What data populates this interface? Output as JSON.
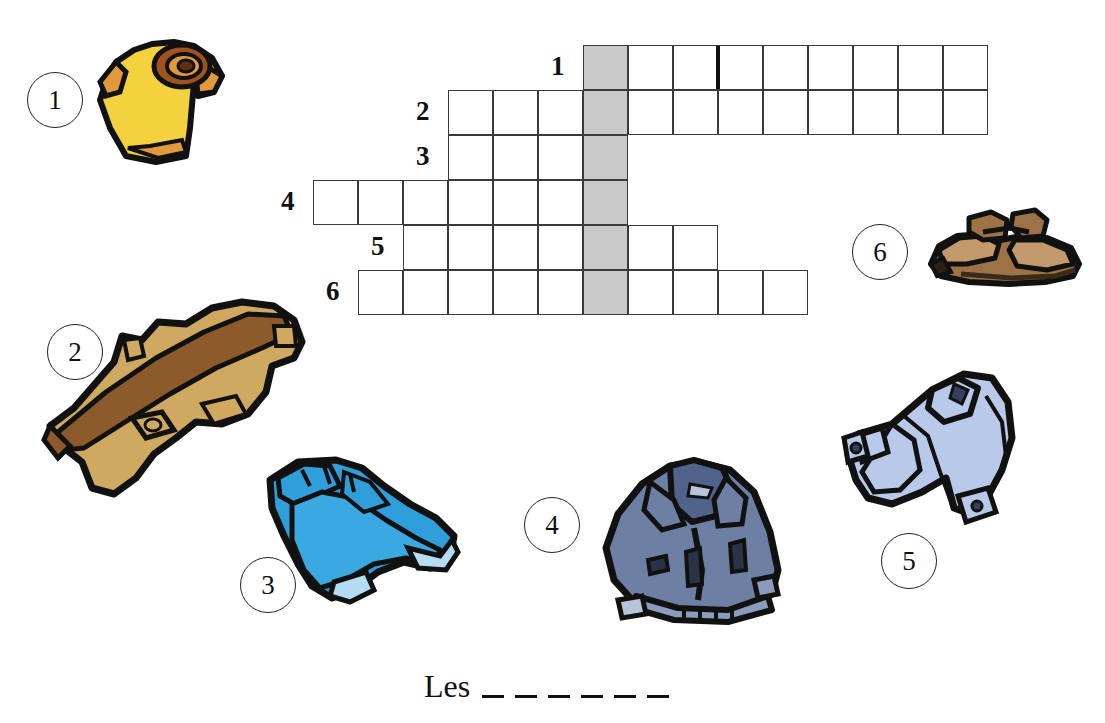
{
  "worksheet": {
    "title": "Crossword puzzle - clothing vocabulary",
    "answer_prompt": "Les",
    "answer_blank_count": 6
  },
  "grid": {
    "cell_size": 45,
    "origin_x": 583,
    "origin_y": 45,
    "shaded_color": "#c9c9c9",
    "border_color": "#3a3a3a",
    "rows": [
      {
        "number": "1",
        "cells_left": 0,
        "cells_right": 8,
        "divider_after": 3
      },
      {
        "number": "2",
        "cells_left": 3,
        "cells_right": 8,
        "divider_after": null
      },
      {
        "number": "3",
        "cells_left": 3,
        "cells_right": 0,
        "divider_after": null
      },
      {
        "number": "4",
        "cells_left": 6,
        "cells_right": 0,
        "divider_after": null
      },
      {
        "number": "5",
        "cells_left": 4,
        "cells_right": 2,
        "divider_after": null
      },
      {
        "number": "6",
        "cells_left": 5,
        "cells_right": 4,
        "divider_after": null
      }
    ]
  },
  "items": [
    {
      "number": "1",
      "name": "t-shirt",
      "icon": "tshirt-icon",
      "color": "#f5d council"
    },
    {
      "number": "2",
      "name": "trench-coat",
      "icon": "trenchcoat-icon",
      "color": "#cfa960"
    },
    {
      "number": "3",
      "name": "jeans",
      "icon": "jeans-icon",
      "color": "#2f9fdc"
    },
    {
      "number": "4",
      "name": "jacket",
      "icon": "jacket-icon",
      "color": "#6d80a4"
    },
    {
      "number": "5",
      "name": "shirt",
      "icon": "shirt-icon",
      "color": "#b9c9ea"
    },
    {
      "number": "6",
      "name": "shoes",
      "icon": "shoes-icon",
      "color": "#9d7246"
    }
  ]
}
